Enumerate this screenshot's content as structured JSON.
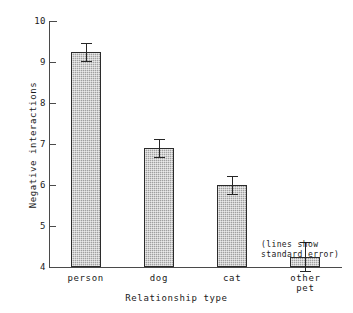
{
  "chart_data": {
    "type": "bar",
    "title": "",
    "xlabel": "Relationship type",
    "ylabel": "Negative interactions",
    "categories": [
      "person",
      "dog",
      "cat",
      "other\npet"
    ],
    "values": [
      9.25,
      6.9,
      6.0,
      4.25
    ],
    "errors": [
      0.22,
      0.22,
      0.22,
      0.35
    ],
    "series": [
      {
        "name": "Negative interactions",
        "values": [
          9.25,
          6.9,
          6.0,
          4.25
        ],
        "errors": [
          0.22,
          0.22,
          0.22,
          0.35
        ]
      }
    ],
    "ylim": [
      4,
      10
    ],
    "yticks": [
      10,
      9,
      8,
      7,
      6,
      5,
      4
    ],
    "ytick_labels": [
      "10",
      "9",
      "8",
      "7",
      "6",
      "5",
      "4"
    ],
    "grid": false,
    "legend": "none",
    "annotation": "(lines show\nstandard error)",
    "bar_fill_color": "#a0a0a0",
    "bar_edge_color": "#2b2b2b",
    "axis_color": "#4a4a4a",
    "text_color": "#1a1a1a"
  },
  "axes": {
    "y_title": "Negative interactions",
    "x_title": "Relationship type"
  },
  "ticks": {
    "y": [
      {
        "label": "10"
      },
      {
        "label": "9"
      },
      {
        "label": "8"
      },
      {
        "label": "7"
      },
      {
        "label": "6"
      },
      {
        "label": "5"
      },
      {
        "label": "4"
      }
    ]
  },
  "bars": [
    {
      "label": "person",
      "value": "9.25",
      "error": "0.22"
    },
    {
      "label": "dog",
      "value": "6.9",
      "error": "0.22"
    },
    {
      "label": "cat",
      "value": "6.0",
      "error": "0.22"
    },
    {
      "label": "other\npet",
      "value": "4.25",
      "error": "0.35"
    }
  ],
  "annotation": {
    "text": "(lines show\nstandard error)"
  }
}
